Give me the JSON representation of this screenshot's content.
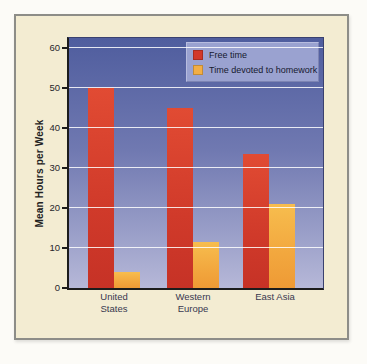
{
  "palette": {
    "page_background": "#fcfbf7",
    "card_background": "#f3ecd2",
    "card_border": "#8d8d88",
    "gridline": "#ffffff",
    "axis_line": "#1c1c1c",
    "tick_text": "#26262a",
    "legend_background": "#9aa2d0"
  },
  "chart_data": {
    "type": "bar",
    "title": "",
    "categories": [
      "United States",
      "Western Europe",
      "East Asia"
    ],
    "category_lines": [
      [
        "United",
        "States"
      ],
      [
        "Western",
        "Europe"
      ],
      [
        "East Asia"
      ]
    ],
    "series": [
      {
        "name": "Free time",
        "color": "#d2382a",
        "values": [
          50,
          45,
          33.5
        ]
      },
      {
        "name": "Time devoted to homework",
        "color": "#f3ae44",
        "values": [
          4,
          11.5,
          21
        ]
      }
    ],
    "xlabel": "",
    "ylabel": "Mean Hours per Week",
    "ylim": [
      0,
      62.5
    ],
    "yticks": [
      0,
      10,
      20,
      30,
      40,
      50,
      60
    ],
    "grid": true,
    "grid_color": "#ffffff",
    "legend_position": "top-right",
    "plot_background": {
      "top": "#4f5d9e",
      "bottom": "#b6b8d8"
    }
  }
}
